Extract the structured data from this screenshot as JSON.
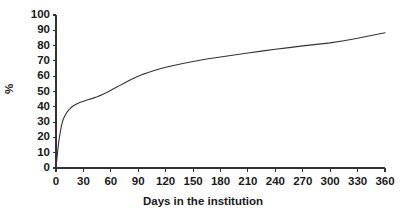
{
  "chart_data": {
    "type": "line",
    "title": "",
    "xlabel": "Days in the institution",
    "ylabel": "%",
    "xlim": [
      0,
      360
    ],
    "ylim": [
      0,
      100
    ],
    "grid": false,
    "legend": false,
    "xticks": [
      0,
      30,
      60,
      90,
      120,
      150,
      180,
      210,
      240,
      270,
      300,
      330,
      360
    ],
    "yticks": [
      0,
      10,
      20,
      30,
      40,
      50,
      60,
      70,
      80,
      90,
      100
    ],
    "line_color": "#333333",
    "line_width": 1.1,
    "series": [
      {
        "name": "cumulative percentage",
        "x": [
          0,
          1,
          2,
          3,
          4,
          5,
          6,
          7,
          8,
          10,
          12,
          14,
          16,
          18,
          20,
          23,
          26,
          30,
          35,
          40,
          45,
          50,
          55,
          60,
          65,
          70,
          75,
          80,
          85,
          90,
          95,
          100,
          110,
          120,
          130,
          140,
          150,
          165,
          180,
          195,
          210,
          225,
          240,
          255,
          270,
          285,
          300,
          315,
          330,
          345,
          360
        ],
        "y": [
          0,
          6,
          12,
          17,
          21,
          24.5,
          27.5,
          30,
          32,
          34.5,
          36.5,
          38,
          39.2,
          40.2,
          41,
          42,
          42.8,
          43.6,
          44.6,
          45.5,
          46.6,
          47.8,
          49.2,
          50.8,
          52.4,
          54,
          55.6,
          57.2,
          58.6,
          60,
          61.2,
          62.3,
          64.2,
          65.8,
          67.2,
          68.5,
          69.6,
          71.2,
          72.6,
          73.9,
          75.2,
          76.4,
          77.6,
          78.7,
          79.8,
          80.8,
          81.8,
          83.2,
          84.8,
          86.6,
          88.4
        ]
      }
    ]
  },
  "axis_style": {
    "tick_font_size": "11.5px",
    "axis_color": "#333333"
  }
}
